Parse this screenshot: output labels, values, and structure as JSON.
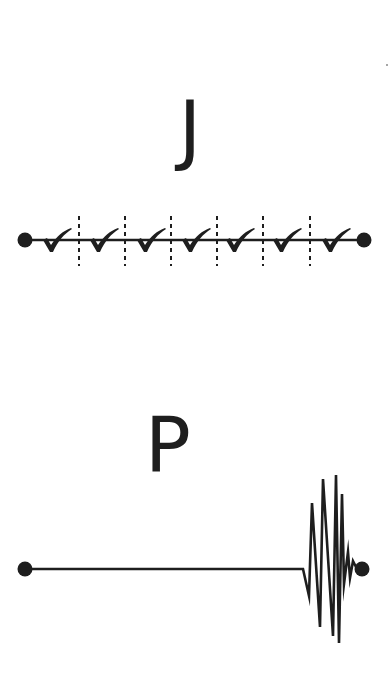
{
  "panels": [
    {
      "label": "J",
      "type": "segmented-timeline",
      "segment_count": 7,
      "segment_icon": "checkmark-icon",
      "divider_style": "dashed"
    },
    {
      "label": "P",
      "type": "flat-line-with-burst",
      "end_feature": "oscillation-burst"
    }
  ],
  "checkmarks": [
    "✓",
    "✓",
    "✓",
    "✓",
    "✓",
    "✓",
    "✓"
  ],
  "colors": {
    "ink": "#1e1e1e",
    "background": "#ffffff"
  }
}
